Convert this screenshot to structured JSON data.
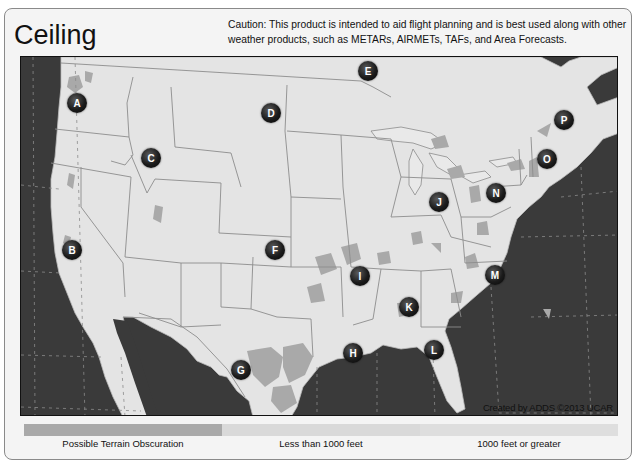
{
  "header": {
    "title": "Ceiling",
    "caution": "Caution: This product is intended to aid flight planning and is best used along with other weather products, such as METARs, AIRMETs, TAFs, and Area Forecasts."
  },
  "map": {
    "region": "Continental United States",
    "credit": "Created by ADDS ©2013 UCAR",
    "colors": {
      "ocean": "#3a3a3a",
      "land": "#e4e4e4",
      "terrain": "#a9a9a9",
      "borders": "#8c8c8c"
    },
    "markers": [
      {
        "label": "A",
        "x": 56,
        "y": 46
      },
      {
        "label": "B",
        "x": 51,
        "y": 193
      },
      {
        "label": "C",
        "x": 130,
        "y": 101
      },
      {
        "label": "D",
        "x": 250,
        "y": 56
      },
      {
        "label": "E",
        "x": 347,
        "y": 14
      },
      {
        "label": "F",
        "x": 254,
        "y": 193
      },
      {
        "label": "G",
        "x": 220,
        "y": 313
      },
      {
        "label": "H",
        "x": 332,
        "y": 296
      },
      {
        "label": "I",
        "x": 339,
        "y": 219
      },
      {
        "label": "J",
        "x": 418,
        "y": 145
      },
      {
        "label": "K",
        "x": 388,
        "y": 250
      },
      {
        "label": "L",
        "x": 413,
        "y": 293
      },
      {
        "label": "M",
        "x": 474,
        "y": 218
      },
      {
        "label": "N",
        "x": 475,
        "y": 136
      },
      {
        "label": "O",
        "x": 526,
        "y": 102
      },
      {
        "label": "P",
        "x": 543,
        "y": 63
      }
    ]
  },
  "legend": {
    "items": [
      {
        "label": "Possible Terrain Obscuration",
        "color": "#a9a9a9"
      },
      {
        "label": "Less than 1000 feet",
        "color": "#d9d9d9"
      },
      {
        "label": "1000 feet or greater",
        "color": "#dedede"
      }
    ]
  }
}
